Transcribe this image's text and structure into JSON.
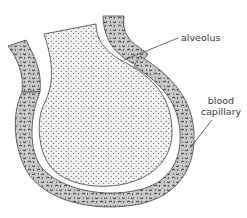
{
  "diagram": {
    "labels": {
      "alveolus": "alveolus",
      "blood_capillary_line1": "blood",
      "blood_capillary_line2": "capillary"
    },
    "colors": {
      "capillary_fill": "#c9c9c9",
      "capillary_outline": "#555555",
      "alveolus_fill": "#f2f2f2",
      "alveolus_dots": "#2a2a2a",
      "blood_cells": "#1e1e1e",
      "leader_line": "#444444",
      "background": "#ffffff"
    }
  }
}
